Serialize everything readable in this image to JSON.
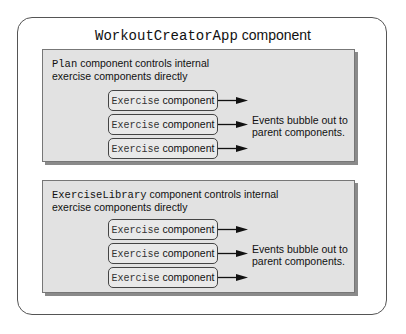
{
  "title": {
    "code": "WorkoutCreatorApp",
    "text": " component"
  },
  "panels": [
    {
      "code": "Plan",
      "line1_text": " component controls internal",
      "line2": "exercise components directly",
      "exercises": [
        {
          "code": "Exercise",
          "text": " component"
        },
        {
          "code": "Exercise",
          "text": " component"
        },
        {
          "code": "Exercise",
          "text": " component"
        }
      ],
      "events_line1": "Events bubble out to",
      "events_line2": "parent components."
    },
    {
      "code": "ExerciseLibrary",
      "line1_text": " component controls internal",
      "line2": "exercise components directly",
      "exercises": [
        {
          "code": "Exercise",
          "text": " component"
        },
        {
          "code": "Exercise",
          "text": " component"
        },
        {
          "code": "Exercise",
          "text": " component"
        }
      ],
      "events_line1": "Events bubble out to",
      "events_line2": "parent components."
    }
  ],
  "colors": {
    "panel_bg": "#e2e2e2",
    "border": "#555555",
    "shadow": "#8a8a8a"
  }
}
